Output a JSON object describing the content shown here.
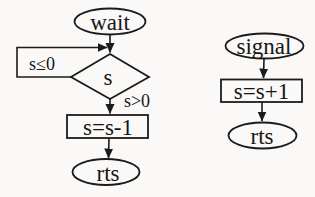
{
  "canvas": {
    "width": 315,
    "height": 197,
    "background": "#faf9f7",
    "ink": "#1b1b1b"
  },
  "left_flow": {
    "start_label": "wait",
    "decision_label": "s",
    "loop_edge_label": "s≤0",
    "exit_edge_label": "s>0",
    "process_label": "s=s-1",
    "end_label": "rts"
  },
  "right_flow": {
    "start_label": "signal",
    "process_label": "s=s+1",
    "end_label": "rts"
  }
}
